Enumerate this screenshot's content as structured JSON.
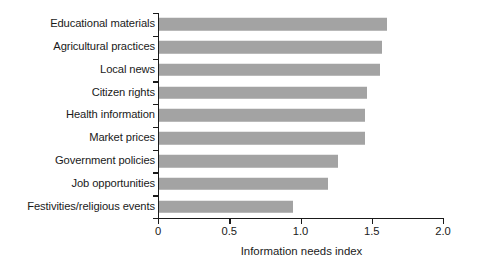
{
  "chart_data": {
    "type": "bar",
    "orientation": "horizontal",
    "title": "",
    "subtitle": "",
    "xlabel": "Information needs index",
    "ylabel": "",
    "categories": [
      "Educational materials",
      "Agricultural practices",
      "Local news",
      "Citizen rights",
      "Health information",
      "Market prices",
      "Government policies",
      "Job opportunities",
      "Festivities/religious events"
    ],
    "values": [
      1.61,
      1.57,
      1.56,
      1.47,
      1.45,
      1.45,
      1.26,
      1.19,
      0.95
    ],
    "xlim": [
      0,
      2.0
    ],
    "xticks": [
      0,
      0.5,
      1.0,
      1.5,
      2.0
    ],
    "xtick_labels": [
      "0",
      "0.5",
      "1.0",
      "1.5",
      "2.0"
    ],
    "grid": false,
    "legend": null,
    "bar_color": "#a3a3a3",
    "axis_color": "#1a1a1a"
  }
}
